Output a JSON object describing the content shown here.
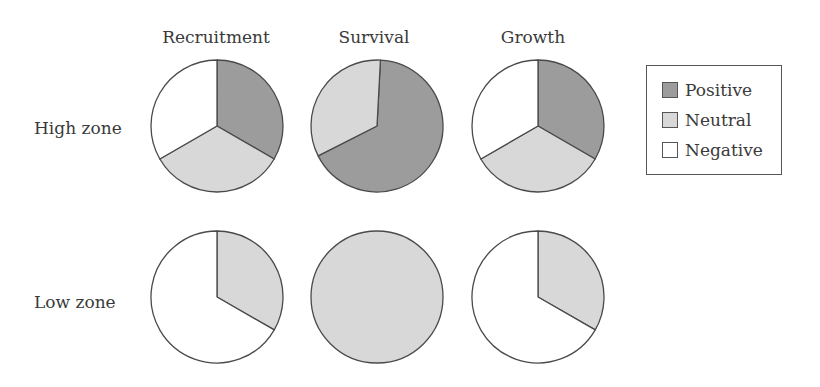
{
  "colors": {
    "positive": "#9c9c9c",
    "neutral": "#d8d8d8",
    "negative": "#ffffff",
    "stroke": "#4a4a4a"
  },
  "columns": [
    "Recruitment",
    "Survival",
    "Growth"
  ],
  "rows": [
    "High zone",
    "Low zone"
  ],
  "legend": {
    "items": [
      {
        "label": "Positive",
        "key": "positive"
      },
      {
        "label": "Neutral",
        "key": "neutral"
      },
      {
        "label": "Negative",
        "key": "negative"
      }
    ]
  },
  "chart_data": {
    "type": "pie",
    "title": "",
    "layout": "grid 2 rows x 3 columns",
    "legend_position": "right",
    "legend": [
      "Positive",
      "Neutral",
      "Negative"
    ],
    "row_labels": [
      "High zone",
      "Low zone"
    ],
    "column_labels": [
      "Recruitment",
      "Survival",
      "Growth"
    ],
    "pies": [
      {
        "row": "High zone",
        "column": "Recruitment",
        "slices": [
          {
            "label": "Positive",
            "value": 33.3
          },
          {
            "label": "Neutral",
            "value": 33.3
          },
          {
            "label": "Negative",
            "value": 33.3
          }
        ]
      },
      {
        "row": "High zone",
        "column": "Survival",
        "slices": [
          {
            "label": "Positive",
            "value": 66.7
          },
          {
            "label": "Neutral",
            "value": 33.3
          },
          {
            "label": "Negative",
            "value": 0
          }
        ]
      },
      {
        "row": "High zone",
        "column": "Growth",
        "slices": [
          {
            "label": "Positive",
            "value": 33.3
          },
          {
            "label": "Neutral",
            "value": 33.3
          },
          {
            "label": "Negative",
            "value": 33.3
          }
        ]
      },
      {
        "row": "Low zone",
        "column": "Recruitment",
        "slices": [
          {
            "label": "Positive",
            "value": 0
          },
          {
            "label": "Neutral",
            "value": 33.3
          },
          {
            "label": "Negative",
            "value": 66.7
          }
        ]
      },
      {
        "row": "Low zone",
        "column": "Survival",
        "slices": [
          {
            "label": "Positive",
            "value": 0
          },
          {
            "label": "Neutral",
            "value": 100
          },
          {
            "label": "Negative",
            "value": 0
          }
        ]
      },
      {
        "row": "Low zone",
        "column": "Growth",
        "slices": [
          {
            "label": "Positive",
            "value": 0
          },
          {
            "label": "Neutral",
            "value": 33.3
          },
          {
            "label": "Negative",
            "value": 66.7
          }
        ]
      }
    ]
  }
}
